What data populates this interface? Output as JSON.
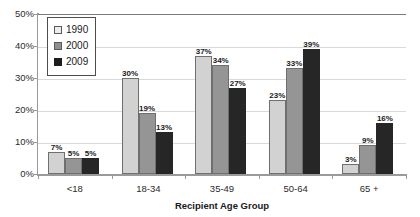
{
  "chart_data": {
    "type": "bar",
    "title": "",
    "subtitle": "",
    "xlabel": "Recipient Age Group",
    "ylabel": "",
    "categories": [
      "<18",
      "18-34",
      "35-49",
      "50-64",
      "65 +"
    ],
    "series": [
      {
        "name": "1990",
        "color": "#d2d2d2",
        "values": [
          7,
          30,
          37,
          23,
          3
        ],
        "labels": [
          "7%",
          "30%",
          "37%",
          "23%",
          "3%"
        ]
      },
      {
        "name": "2000",
        "color": "#959595",
        "values": [
          5,
          19,
          34,
          33,
          9
        ],
        "labels": [
          "5%",
          "19%",
          "34%",
          "33%",
          "9%"
        ]
      },
      {
        "name": "2009",
        "color": "#262626",
        "values": [
          5,
          13,
          27,
          39,
          16
        ],
        "labels": [
          "5%",
          "13%",
          "27%",
          "39%",
          "16%"
        ]
      }
    ],
    "ylim": [
      0,
      50
    ],
    "ytick_values": [
      0,
      10,
      20,
      30,
      40,
      50
    ],
    "ytick_labels": [
      "0%",
      "10%",
      "20%",
      "30%",
      "40%",
      "50%"
    ],
    "grid": true,
    "grid_axis": "y",
    "legend_position": "top-left",
    "value_labels_shown": true,
    "value_label_unit": "%"
  },
  "legend": {
    "entries": [
      {
        "label": "1990",
        "swatch": "legend-swatch-light"
      },
      {
        "label": "2000",
        "swatch": "legend-swatch-medium"
      },
      {
        "label": "2009",
        "swatch": "legend-swatch-dark"
      }
    ]
  }
}
